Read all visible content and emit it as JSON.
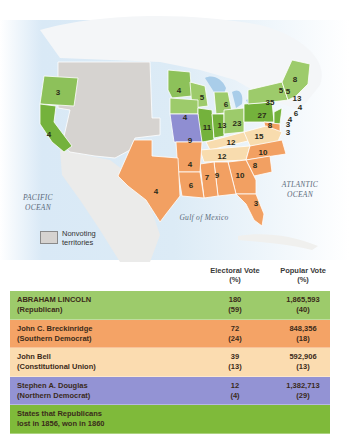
{
  "map": {
    "oceans": {
      "pacific": [
        "PACIFIC",
        "OCEAN"
      ],
      "atlantic": [
        "ATLANTIC",
        "OCEAN"
      ],
      "gulf": "Gulf of Mexico"
    },
    "legend": {
      "label": "Nonvoting territories",
      "swatch_color": "#d6d3d0"
    },
    "state_votes": {
      "OR": "3",
      "CA": "4",
      "MN": "4",
      "WI": "5",
      "MI": "6",
      "IA": "4",
      "IL": "11",
      "IN": "13",
      "OH": "23",
      "PA": "27",
      "NY": "35",
      "ME": "8",
      "VT": "5",
      "NH": "5",
      "MA": "13",
      "RI": "4",
      "CT": "6",
      "NJ": "4",
      "DE": "3",
      "MD": "8",
      "MD2": "3",
      "MO": "9",
      "KY": "12",
      "VA": "15",
      "TN": "12",
      "NC": "10",
      "SC": "8",
      "GA": "10",
      "AL": "9",
      "MS": "7",
      "LA": "6",
      "AR": "4",
      "TX": "4",
      "FL": "3"
    }
  },
  "colors": {
    "republican": "#8dc15a",
    "republican_flip": "#74b23c",
    "southern_democrat": "#f2a062",
    "constitutional_union": "#f8dcae",
    "northern_democrat": "#8f8ed2",
    "territory": "#d6d3d0",
    "water": "#cfe3f3"
  },
  "table": {
    "headers": {
      "electoral": [
        "Electoral Vote",
        "(%)"
      ],
      "popular": [
        "Popular Vote",
        "(%)"
      ]
    },
    "rows": [
      {
        "name": "ABRAHAM LINCOLN",
        "party": "(Republican)",
        "ev": "180",
        "ev_pct": "(59)",
        "pv": "1,865,593",
        "pv_pct": "(40)",
        "color": "#9dcb6b"
      },
      {
        "name": "John C. Breckinridge",
        "party": "(Southern Democrat)",
        "ev": "72",
        "ev_pct": "(24)",
        "pv": "848,356",
        "pv_pct": "(18)",
        "color": "#f4a366"
      },
      {
        "name": "John Bell",
        "party": "(Constitutional Union)",
        "ev": "39",
        "ev_pct": "(13)",
        "pv": "592,906",
        "pv_pct": "(13)",
        "color": "#fbdcb0"
      },
      {
        "name": "Stephen A. Douglas",
        "party": "(Northern Democrat)",
        "ev": "12",
        "ev_pct": "(4)",
        "pv": "1,382,713",
        "pv_pct": "(29)",
        "color": "#9393d4"
      },
      {
        "name": "States that Republicans",
        "party": "lost in 1856, won in 1860",
        "ev": "",
        "ev_pct": "",
        "pv": "",
        "pv_pct": "",
        "color": "#7fba3a"
      }
    ]
  }
}
